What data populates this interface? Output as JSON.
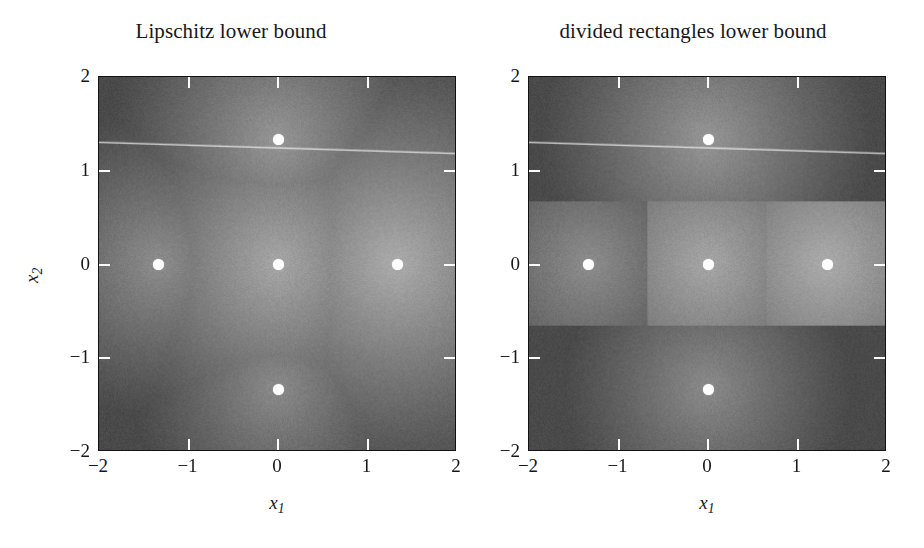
{
  "figure": {
    "background": "#ffffff",
    "type": "two-panel-heatmap"
  },
  "panels": [
    {
      "id": "lipschitz",
      "title": "Lipschitz lower bound"
    },
    {
      "id": "divided-rectangles",
      "title": "divided rectangles lower bound"
    }
  ],
  "axes": {
    "xlabel": "x",
    "xlabel_sub": "1",
    "ylabel": "x",
    "ylabel_sub": "2",
    "xticks": [
      "−2",
      "−1",
      "0",
      "1",
      "2"
    ],
    "yticks": [
      "2",
      "1",
      "0",
      "−1",
      "−2"
    ],
    "xtick_values": [
      -2,
      -1,
      0,
      1,
      2
    ],
    "ytick_values": [
      2,
      1,
      0,
      -1,
      -2
    ],
    "xlim": [
      -2,
      2
    ],
    "ylim": [
      -2,
      2
    ]
  },
  "chart_data": {
    "type": "heatmap",
    "xlabel": "x1",
    "ylabel": "x2",
    "xlim": [
      -2,
      2
    ],
    "ylim": [
      -2,
      2
    ],
    "grid": false,
    "legend": "none",
    "colormap": "grayscale",
    "colormap_low": "#4f4f4f",
    "colormap_high": "#f2f2f2",
    "value_range": [
      -3.2,
      1.4
    ],
    "sample_points": [
      {
        "x": 0.0,
        "y": 1.333
      },
      {
        "x": -1.333,
        "y": 0.0
      },
      {
        "x": 0.0,
        "y": 0.0
      },
      {
        "x": 1.333,
        "y": 0.0
      },
      {
        "x": 0.0,
        "y": -1.333
      }
    ],
    "sample_values": [
      -1.05,
      -1.28,
      -0.62,
      -0.48,
      -1.35
    ],
    "lipschitz_constant": 1.15,
    "series": [
      {
        "name": "Lipschitz lower bound",
        "panel": 0,
        "description": "max over samples of f(xi) - L*||x - xi||, a union of downward cones"
      },
      {
        "name": "divided rectangles lower bound",
        "panel": 1,
        "description": "piecewise-constant-offset lower bound on axis-aligned rectangular cells",
        "rectangles": [
          {
            "x0": -2.0,
            "x1": 2.0,
            "y0": 0.667,
            "y1": 2.0,
            "center_x": 0.0,
            "center_y": 1.333,
            "value": -1.05
          },
          {
            "x0": -2.0,
            "x1": -0.667,
            "y0": -0.667,
            "y1": 0.667,
            "center_x": -1.333,
            "center_y": 0.0,
            "value": -1.28
          },
          {
            "x0": -0.667,
            "x1": 0.667,
            "y0": -0.667,
            "y1": 0.667,
            "center_x": 0.0,
            "center_y": 0.0,
            "value": -0.62
          },
          {
            "x0": 0.667,
            "x1": 2.0,
            "y0": -0.667,
            "y1": 0.667,
            "center_x": 1.333,
            "center_y": 0.0,
            "value": -0.48
          },
          {
            "x0": -2.0,
            "x1": 2.0,
            "y0": -2.0,
            "y1": -0.667,
            "center_x": 0.0,
            "center_y": -1.333,
            "value": -1.35
          }
        ]
      }
    ],
    "annotations": [
      {
        "type": "contour-line",
        "panel": 0,
        "description": "bright cone-intersection ridge crossing near x2 = 1.25"
      },
      {
        "type": "contour-line",
        "panel": 1,
        "description": "bright cone-intersection ridge crossing near x2 = 1.25"
      }
    ]
  }
}
